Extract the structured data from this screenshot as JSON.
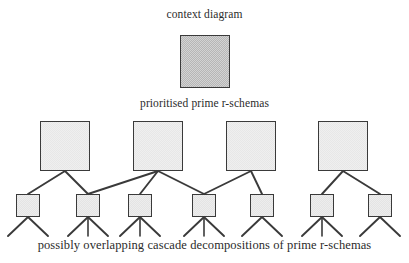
{
  "diagram": {
    "type": "tree-hierarchy",
    "levels": 3,
    "labels": {
      "top": "context diagram",
      "middle": "prioritised prime r-schemas",
      "bottom": "possibly overlapping cascade decompositions of prime r-schemas"
    },
    "colors": {
      "context_fill": "#b6b6b6",
      "node_fill": "#efefef",
      "stroke": "#3a3a3a",
      "text": "#2b2b2b",
      "background": "#ffffff"
    },
    "context_node": {
      "x": 180,
      "y": 35,
      "w": 50,
      "h": 53
    },
    "prime_nodes": [
      {
        "id": "p1",
        "x": 40,
        "y": 121,
        "w": 50,
        "h": 50
      },
      {
        "id": "p2",
        "x": 133,
        "y": 121,
        "w": 50,
        "h": 50
      },
      {
        "id": "p3",
        "x": 226,
        "y": 121,
        "w": 50,
        "h": 50
      },
      {
        "id": "p4",
        "x": 318,
        "y": 121,
        "w": 50,
        "h": 50
      }
    ],
    "cascade_nodes": [
      {
        "id": "c1",
        "x": 16,
        "y": 194,
        "w": 24,
        "h": 23,
        "legs": 2
      },
      {
        "id": "c2",
        "x": 76,
        "y": 194,
        "w": 24,
        "h": 23,
        "legs": 3
      },
      {
        "id": "c3",
        "x": 128,
        "y": 194,
        "w": 24,
        "h": 23,
        "legs": 3
      },
      {
        "id": "c4",
        "x": 192,
        "y": 194,
        "w": 24,
        "h": 23,
        "legs": 3
      },
      {
        "id": "c5",
        "x": 250,
        "y": 194,
        "w": 24,
        "h": 23,
        "legs": 2
      },
      {
        "id": "c6",
        "x": 310,
        "y": 194,
        "w": 24,
        "h": 23,
        "legs": 3
      },
      {
        "id": "c7",
        "x": 368,
        "y": 194,
        "w": 24,
        "h": 23,
        "legs": 2
      }
    ],
    "edges": [
      {
        "from": "p1",
        "to": "c1"
      },
      {
        "from": "p1",
        "to": "c2"
      },
      {
        "from": "p2",
        "to": "c2"
      },
      {
        "from": "p2",
        "to": "c3"
      },
      {
        "from": "p2",
        "to": "c4"
      },
      {
        "from": "p3",
        "to": "c4"
      },
      {
        "from": "p3",
        "to": "c5"
      },
      {
        "from": "p4",
        "to": "c6"
      },
      {
        "from": "p4",
        "to": "c7"
      }
    ]
  }
}
